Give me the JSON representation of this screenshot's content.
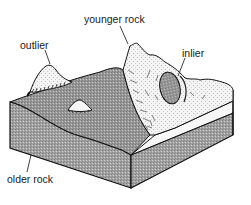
{
  "diagram": {
    "type": "block-diagram",
    "labels": {
      "younger_rock": "younger rock",
      "outlier": "outlier",
      "inlier": "inlier",
      "older_rock": "older rock"
    },
    "colors": {
      "older_rock_fill": "#9a9a9a",
      "older_rock_side": "#a8a8a8",
      "younger_rock_fill": "#f2f2f2",
      "outline": "#111111",
      "label_text": "#1a1a1a"
    }
  }
}
